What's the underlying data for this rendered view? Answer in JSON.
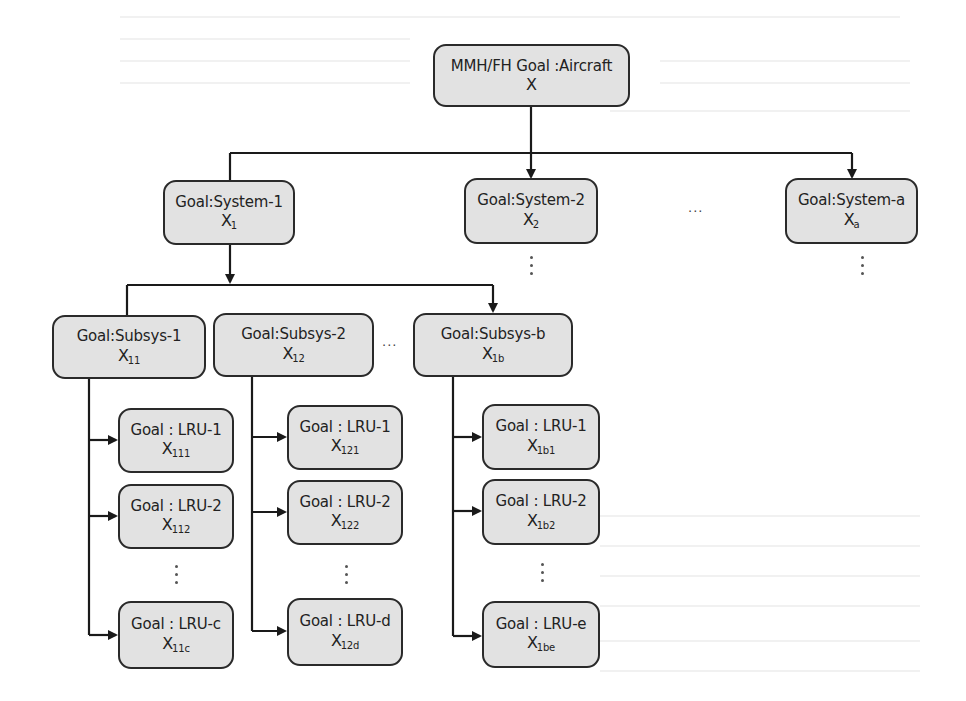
{
  "diagram": {
    "type": "hierarchy-tree",
    "root": {
      "title": "MMH/FH Goal :Aircraft",
      "var": "X",
      "sub": ""
    },
    "systems": [
      {
        "title": "Goal:System-1",
        "var": "X",
        "sub": "1"
      },
      {
        "title": "Goal:System-2",
        "var": "X",
        "sub": "2"
      },
      {
        "title": "Goal:System-a",
        "var": "X",
        "sub": "a"
      }
    ],
    "subsystems": [
      {
        "title": "Goal:Subsys-1",
        "var": "X",
        "sub": "11"
      },
      {
        "title": "Goal:Subsys-2",
        "var": "X",
        "sub": "12"
      },
      {
        "title": "Goal:Subsys-b",
        "var": "X",
        "sub": "1b"
      }
    ],
    "lru_columns": [
      {
        "parent": "Goal:Subsys-1",
        "items": [
          {
            "title": "Goal : LRU-1",
            "var": "X",
            "sub": "111"
          },
          {
            "title": "Goal : LRU-2",
            "var": "X",
            "sub": "112"
          },
          {
            "title": "Goal : LRU-c",
            "var": "X",
            "sub": "11c"
          }
        ]
      },
      {
        "parent": "Goal:Subsys-2",
        "items": [
          {
            "title": "Goal : LRU-1",
            "var": "X",
            "sub": "121"
          },
          {
            "title": "Goal : LRU-2",
            "var": "X",
            "sub": "122"
          },
          {
            "title": "Goal : LRU-d",
            "var": "X",
            "sub": "12d"
          }
        ]
      },
      {
        "parent": "Goal:Subsys-b",
        "items": [
          {
            "title": "Goal : LRU-1",
            "var": "X",
            "sub": "1b1"
          },
          {
            "title": "Goal : LRU-2",
            "var": "X",
            "sub": "1b2"
          },
          {
            "title": "Goal : LRU-e",
            "var": "X",
            "sub": "1be"
          }
        ]
      }
    ],
    "ellipsis_h": "···",
    "colors": {
      "box_fill": "#e2e2e2",
      "box_border": "#2a2a2a",
      "line": "#1a1a1a"
    }
  }
}
